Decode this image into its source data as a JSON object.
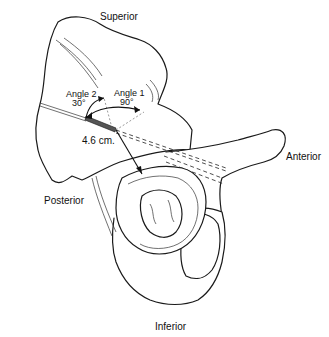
{
  "figure": {
    "orientation_labels": {
      "superior": "Superior",
      "inferior": "Inferior",
      "anterior": "Anterior",
      "posterior": "Posterior"
    },
    "annotations": {
      "angle1_label": "Angle 1",
      "angle1_value": "90°",
      "angle2_label": "Angle 2",
      "angle2_value": "30°",
      "distance": "4.6 cm."
    },
    "colors": {
      "line": "#1a1a1a",
      "background": "#ffffff"
    }
  }
}
